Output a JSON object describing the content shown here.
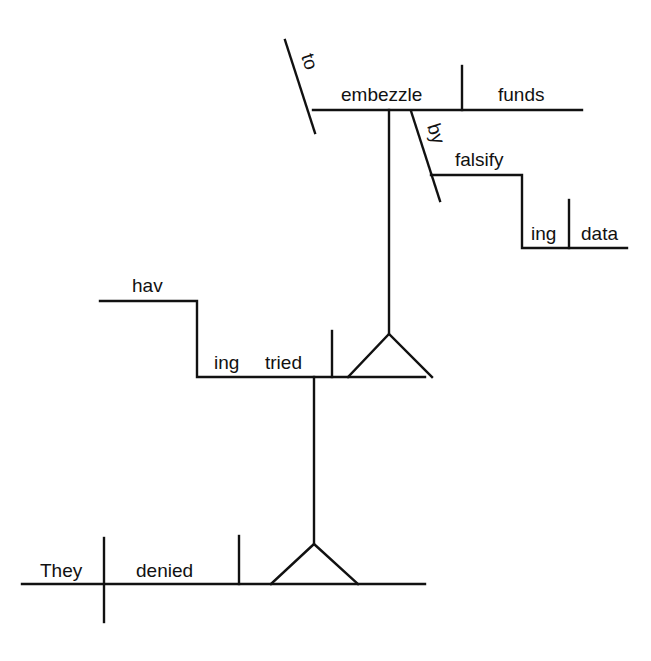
{
  "diagram": {
    "type": "sentence-diagram",
    "sentence": "They denied having tried to embezzle funds by falsifying data",
    "words": {
      "subject": "They",
      "verb": "denied",
      "gerund_hav": "hav",
      "gerund_ing": "ing",
      "gerund_verb": "tried",
      "infinitive_marker": "to",
      "infinitive_verb": "embezzle",
      "infinitive_object": "funds",
      "preposition": "by",
      "prep_gerund": "falsify",
      "prep_gerund_ing": "ing",
      "prep_gerund_object": "data"
    },
    "colors": {
      "line": "#111111",
      "background": "#ffffff"
    }
  }
}
